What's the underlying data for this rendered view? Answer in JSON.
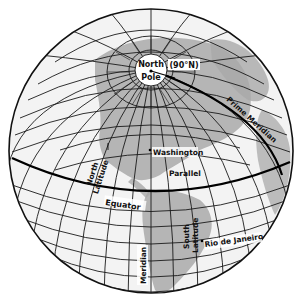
{
  "diagram": {
    "type": "globe-latitude-longitude",
    "colors": {
      "background": "#ffffff",
      "ocean": "#f2f2f2",
      "land": "#a8a8a8",
      "grid": "#1a1a1a",
      "equator": "#000000"
    },
    "labels": {
      "north_pole_line1": "North",
      "north_pole_line2": "Pole",
      "north_pole_degrees": "(90°N)",
      "prime_meridian": "Prime Meridian",
      "washington": "Washington",
      "parallel": "Parallel",
      "north_latitude_line1": "North",
      "north_latitude_line2": "Latitude",
      "equator": "Equator",
      "south_latitude_line1": "South",
      "south_latitude_line2": "Latitude",
      "rio": "Rio de Janeiro",
      "meridian": "Meridian"
    }
  }
}
